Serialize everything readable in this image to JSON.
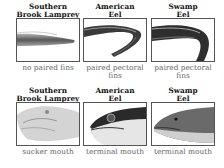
{
  "figure": {
    "rows": [
      {
        "row_topic": "fins",
        "cells": [
          {
            "title_line1": "Southern",
            "title_line2": "Brook Lamprey",
            "image": "lamprey-body-icon",
            "caption_line1": "no paired fins",
            "caption_line2": ""
          },
          {
            "title_line1": "American",
            "title_line2": "Eel",
            "image": "american-eel-body-icon",
            "caption_line1": "paired pectoral",
            "caption_line2": "fins"
          },
          {
            "title_line1": "Swamp",
            "title_line2": "Eel",
            "image": "swamp-eel-body-icon",
            "caption_line1": "paired pectoral",
            "caption_line2": "fins"
          }
        ]
      },
      {
        "row_topic": "mouth",
        "cells": [
          {
            "title_line1": "Southern",
            "title_line2": "Brook Lamprey",
            "image": "lamprey-head-icon",
            "caption_line1": "sucker mouth",
            "caption_line2": ""
          },
          {
            "title_line1": "American",
            "title_line2": "Eel",
            "image": "american-eel-head-icon",
            "caption_line1": "terminal mouth",
            "caption_line2": ""
          },
          {
            "title_line1": "Swamp",
            "title_line2": "Eel",
            "image": "swamp-eel-head-icon",
            "caption_line1": "terminal mouth",
            "caption_line2": ""
          }
        ]
      }
    ]
  }
}
